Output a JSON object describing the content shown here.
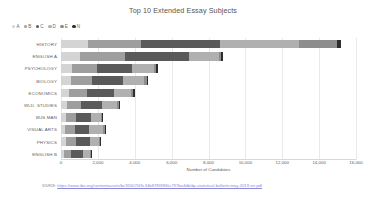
{
  "chart_data": {
    "type": "bar",
    "orientation": "horizontal",
    "stacked": true,
    "title": "Top 10 Extended Essay Subjects",
    "xlabel": "Number of Candidates",
    "ylabel": "",
    "xlim": [
      0,
      16000
    ],
    "xticks": [
      0,
      2000,
      4000,
      6000,
      8000,
      10000,
      12000,
      14000,
      16000
    ],
    "xticklabels": [
      "0",
      "2,000",
      "4,000",
      "6,000",
      "8,000",
      "10,000",
      "12,000",
      "14,000",
      "16,000"
    ],
    "grid": true,
    "legend_position": "top-left",
    "categories": [
      "HISTORY",
      "ENGLISH A",
      "PSYCHOLOGY",
      "BIOLOGY",
      "ECONOMICS",
      "WLD. STUDIES",
      "BUS MAN",
      "VISUAL ARTS",
      "PHYSICS",
      "ENGLISH B"
    ],
    "series": [
      {
        "name": "A",
        "color": "#d4d4d4",
        "values": [
          1450,
          1050,
          620,
          520,
          430,
          320,
          250,
          230,
          270,
          160
        ]
      },
      {
        "name": "B",
        "color": "#9e9e9e",
        "values": [
          2900,
          2400,
          1350,
          1150,
          980,
          780,
          560,
          520,
          560,
          400
        ]
      },
      {
        "name": "C",
        "color": "#5a5a5a",
        "values": [
          4250,
          3500,
          1900,
          1700,
          1450,
          1150,
          830,
          780,
          760,
          620
        ]
      },
      {
        "name": "D",
        "color": "#b0b0b0",
        "values": [
          4300,
          1600,
          1150,
          1150,
          960,
          780,
          530,
          750,
          470,
          420
        ]
      },
      {
        "name": "E",
        "color": "#8d8d8d",
        "values": [
          2050,
          130,
          150,
          140,
          100,
          110,
          70,
          100,
          50,
          40
        ]
      },
      {
        "name": "N",
        "color": "#2e2e2e",
        "values": [
          230,
          120,
          110,
          80,
          70,
          70,
          45,
          70,
          40,
          30
        ]
      }
    ],
    "totals": [
      15180,
      8800,
      5280,
      4740,
      3990,
      3210,
      2285,
      2450,
      2150,
      1670
    ]
  },
  "source": {
    "word": "source:",
    "url": "https://www.ibo.org/contentassets/bc920070f3c34b878f3f8f0c797ba4db/dp-statistical-bulletin-may-2019-en.pdf"
  }
}
